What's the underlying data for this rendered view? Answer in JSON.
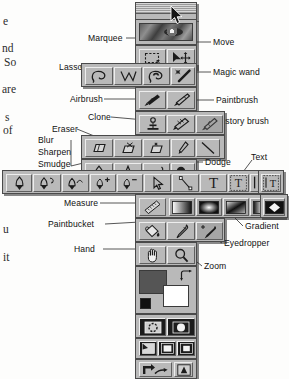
{
  "figure": {
    "palette_title": "",
    "accent_color": "#b9b9b9",
    "line_color": "#2b2b2b",
    "text_color": "#111111"
  },
  "page_text_fragments": [
    {
      "text": "e",
      "x": 3,
      "y": 16
    },
    {
      "text": "nd",
      "x": 2,
      "y": 43
    },
    {
      "text": "So",
      "x": 4,
      "y": 57
    },
    {
      "text": "are",
      "x": 2,
      "y": 84
    },
    {
      "text": "s",
      "x": 5,
      "y": 112
    },
    {
      "text": "of",
      "x": 3,
      "y": 125
    },
    {
      "text": "u",
      "x": 3,
      "y": 224
    },
    {
      "text": "it",
      "x": 3,
      "y": 252
    }
  ],
  "callouts": [
    {
      "id": "marquee",
      "label": "Marquee",
      "side": "left",
      "x": 88,
      "y": 34
    },
    {
      "id": "move",
      "label": "Move",
      "side": "right",
      "x": 213,
      "y": 38
    },
    {
      "id": "lasso",
      "label": "Lasso",
      "side": "left",
      "x": 59,
      "y": 63
    },
    {
      "id": "magic-wand",
      "label": "Magic wand",
      "side": "right",
      "x": 213,
      "y": 68
    },
    {
      "id": "airbrush",
      "label": "Airbrush",
      "side": "left",
      "x": 70,
      "y": 95
    },
    {
      "id": "paintbrush",
      "label": "Paintbrush",
      "side": "right",
      "x": 216,
      "y": 96
    },
    {
      "id": "clone",
      "label": "Clone",
      "side": "left",
      "x": 88,
      "y": 113
    },
    {
      "id": "history-brush",
      "label": "History brush",
      "side": "right",
      "x": 217,
      "y": 117
    },
    {
      "id": "eraser",
      "label": "Eraser",
      "side": "left",
      "x": 52,
      "y": 125
    },
    {
      "id": "blur",
      "label": "Blur",
      "side": "left",
      "x": 38,
      "y": 140
    },
    {
      "id": "sharpen",
      "label": "Sharpen",
      "side": "left",
      "x": 38,
      "y": 151
    },
    {
      "id": "smudge",
      "label": "Smudge",
      "side": "left",
      "x": 38,
      "y": 162
    },
    {
      "id": "dodge",
      "label": "Dodge",
      "side": "right",
      "x": 205,
      "y": 158
    },
    {
      "id": "text",
      "label": "Text",
      "side": "right",
      "x": 251,
      "y": 155
    },
    {
      "id": "measure",
      "label": "Measure",
      "side": "left",
      "x": 64,
      "y": 199
    },
    {
      "id": "paintbucket",
      "label": "Paintbucket",
      "side": "left",
      "x": 57,
      "y": 220
    },
    {
      "id": "gradient",
      "label": "Gradient",
      "side": "right",
      "x": 245,
      "y": 223
    },
    {
      "id": "eyedropper",
      "label": "Eyedropper",
      "side": "right",
      "x": 224,
      "y": 240
    },
    {
      "id": "hand",
      "label": "Hand",
      "side": "left",
      "x": 84,
      "y": 245
    },
    {
      "id": "zoom",
      "label": "Zoom",
      "side": "right",
      "x": 204,
      "y": 263
    }
  ],
  "toolbox": {
    "rows": [
      {
        "name": "selection-row",
        "tools": [
          "marquee",
          "move"
        ]
      },
      {
        "name": "lasso-row",
        "tools": [
          "lasso-freehand",
          "lasso-polygon",
          "lasso-magnetic",
          "magic-wand"
        ]
      },
      {
        "name": "paint-row",
        "tools": [
          "airbrush",
          "paintbrush"
        ]
      },
      {
        "name": "clone-row",
        "tools": [
          "clone-stamp",
          "pattern-stamp",
          "history-brush"
        ]
      },
      {
        "name": "eraser-row",
        "tools": [
          "eraser",
          "background-eraser",
          "magic-eraser",
          "pencil",
          "line"
        ]
      },
      {
        "name": "retouch-row",
        "tools": [
          "blur",
          "sharpen",
          "smudge",
          "dodge"
        ]
      },
      {
        "name": "pen-text-row",
        "tools": [
          "pen",
          "magnetic-pen",
          "freeform-pen",
          "add-anchor-point",
          "delete-anchor-point",
          "direct-selection",
          "path-component",
          "type",
          "type-mask",
          "vertical-type",
          "vertical-type-mask"
        ]
      },
      {
        "name": "measure-row",
        "tools": [
          "measure",
          "linear-gradient",
          "radial-gradient",
          "angle-gradient",
          "reflected-gradient",
          "diamond-gradient"
        ]
      },
      {
        "name": "bucket-row",
        "tools": [
          "paintbucket",
          "eyedropper",
          "color-sampler"
        ]
      },
      {
        "name": "nav-row",
        "tools": [
          "hand",
          "zoom"
        ]
      }
    ],
    "color_controls": {
      "foreground": "#555555",
      "background": "#ffffff",
      "default_colors": "default-colors-icon",
      "swap_colors": "swap-colors-icon"
    },
    "mode_controls": {
      "standard_mask": "standard-mode-icon",
      "quick_mask": "quick-mask-mode-icon",
      "standard_screen": "standard-screen-icon",
      "full_screen_menubar": "full-screen-menubar-icon",
      "full_screen": "full-screen-icon",
      "jump_to": "jump-to-imageready-icon"
    }
  }
}
